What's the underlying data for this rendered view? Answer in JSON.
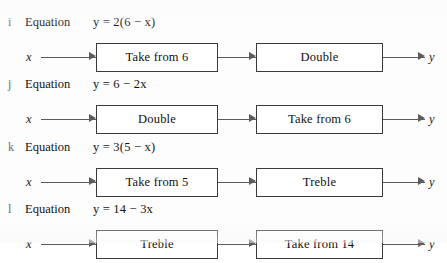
{
  "worksheet": {
    "equation_word": "Equation",
    "input_var": "x",
    "output_var": "y",
    "box_border_color": "#3a3a3a",
    "arrow_color": "#5c5c5c",
    "text_color": "#111111",
    "label_color": "#6d6d6d",
    "background_color": "#fdfdfd"
  },
  "rows": [
    {
      "label": "i",
      "equation": "y = 2(6 − x)",
      "equation_parts": {
        "lhs": "y",
        "rhs": "2(6 − x)"
      },
      "box1": "Take from 6",
      "box2": "Double",
      "input": "x",
      "output": "y"
    },
    {
      "label": "j",
      "equation": "y = 6 − 2x",
      "equation_parts": {
        "lhs": "y",
        "rhs": "6 − 2x"
      },
      "box1": "Double",
      "box2": "Take from 6",
      "input": "x",
      "output": "y"
    },
    {
      "label": "k",
      "equation": "y = 3(5 − x)",
      "equation_parts": {
        "lhs": "y",
        "rhs": "3(5 − x)"
      },
      "box1": "Take from 5",
      "box2": "Treble",
      "input": "x",
      "output": "y"
    },
    {
      "label": "l",
      "equation": "y = 14 − 3x",
      "equation_parts": {
        "lhs": "y",
        "rhs": "14 − 3x"
      },
      "box1": "Treble",
      "box2": "Take from 14",
      "input": "x",
      "output": "y"
    }
  ]
}
